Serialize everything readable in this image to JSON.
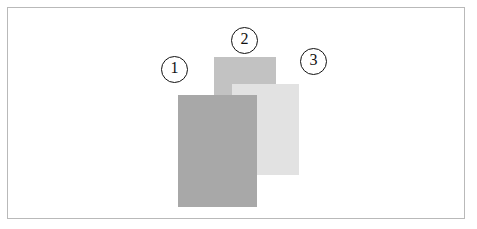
{
  "figure": {
    "background_color": "#ffffff",
    "frame": {
      "border_color": "#b9b9b9",
      "x": 7,
      "y": 7,
      "width": 458,
      "height": 212
    },
    "sheets": [
      {
        "id": "sheet-1",
        "label": "1",
        "color": "#a8a8a8",
        "x": 178,
        "y": 95,
        "width": 79,
        "height": 112,
        "stack_order": "front"
      },
      {
        "id": "sheet-2",
        "label": "2",
        "color": "#c2c2c2",
        "x": 214,
        "y": 57,
        "width": 62,
        "height": 118,
        "stack_order": "back"
      },
      {
        "id": "sheet-3",
        "label": "3",
        "color": "#e2e2e2",
        "x": 232,
        "y": 84,
        "width": 67,
        "height": 91,
        "stack_order": "middle"
      }
    ],
    "callouts": [
      {
        "id": "callout-1",
        "label": "1",
        "x": 161,
        "y": 56
      },
      {
        "id": "callout-2",
        "label": "2",
        "x": 231,
        "y": 27
      },
      {
        "id": "callout-3",
        "label": "3",
        "x": 300,
        "y": 48
      }
    ]
  }
}
